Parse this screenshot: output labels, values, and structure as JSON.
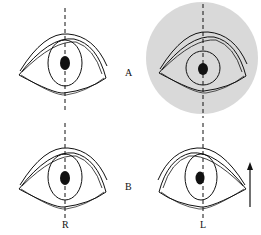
{
  "diagram": {
    "rows": [
      {
        "label": "A"
      },
      {
        "label": "B"
      }
    ],
    "columns": [
      {
        "label": "R"
      },
      {
        "label": "L"
      }
    ],
    "highlight_color": "#d9d9d9",
    "line_color": "#111111",
    "arrow": {
      "direction": "up"
    }
  }
}
